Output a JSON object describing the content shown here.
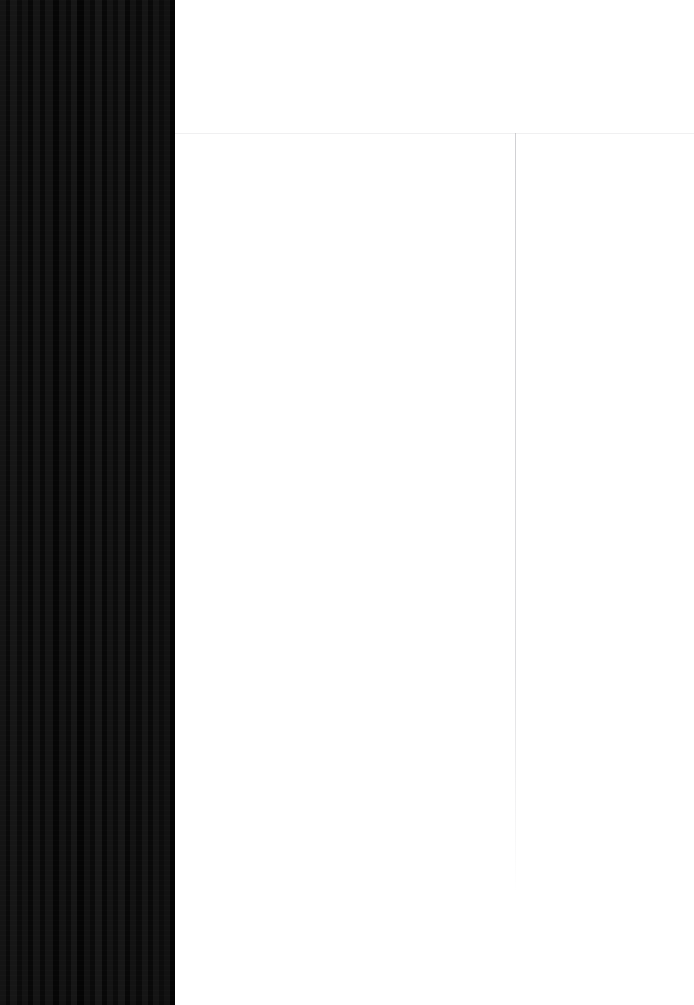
{
  "screen": {
    "width": 694,
    "height": 1005,
    "background_color": "#ffffff"
  },
  "side_panel": {
    "name": "dark-striped-panel",
    "x": 0,
    "y": 0,
    "width": 175,
    "height": 1005,
    "base_color": "#0d0d0d",
    "description": "Dark vertically striped column occupying the left edge of the frame",
    "stripes": [
      {
        "x": 0,
        "width": 6,
        "color": "#141414"
      },
      {
        "x": 6,
        "width": 4,
        "color": "#0a0a0a"
      },
      {
        "x": 10,
        "width": 7,
        "color": "#161616"
      },
      {
        "x": 17,
        "width": 5,
        "color": "#0b0b0b"
      },
      {
        "x": 22,
        "width": 6,
        "color": "#131313"
      },
      {
        "x": 28,
        "width": 5,
        "color": "#080808"
      },
      {
        "x": 33,
        "width": 7,
        "color": "#151515"
      },
      {
        "x": 40,
        "width": 5,
        "color": "#090909"
      },
      {
        "x": 45,
        "width": 8,
        "color": "#141414"
      },
      {
        "x": 53,
        "width": 6,
        "color": "#060606"
      },
      {
        "x": 59,
        "width": 7,
        "color": "#131313"
      },
      {
        "x": 66,
        "width": 5,
        "color": "#0a0a0a"
      },
      {
        "x": 71,
        "width": 6,
        "color": "#161616"
      },
      {
        "x": 77,
        "width": 7,
        "color": "#050505"
      },
      {
        "x": 84,
        "width": 6,
        "color": "#121212"
      },
      {
        "x": 90,
        "width": 5,
        "color": "#0a0a0a"
      },
      {
        "x": 95,
        "width": 7,
        "color": "#171717"
      },
      {
        "x": 102,
        "width": 5,
        "color": "#080808"
      },
      {
        "x": 107,
        "width": 6,
        "color": "#141414"
      },
      {
        "x": 113,
        "width": 5,
        "color": "#0b0b0b"
      },
      {
        "x": 118,
        "width": 7,
        "color": "#161616"
      },
      {
        "x": 125,
        "width": 5,
        "color": "#070707"
      },
      {
        "x": 130,
        "width": 6,
        "color": "#131313"
      },
      {
        "x": 136,
        "width": 6,
        "color": "#0a0a0a"
      },
      {
        "x": 142,
        "width": 6,
        "color": "#151515"
      },
      {
        "x": 148,
        "width": 5,
        "color": "#090909"
      },
      {
        "x": 153,
        "width": 6,
        "color": "#141414"
      },
      {
        "x": 159,
        "width": 5,
        "color": "#0c0c0c"
      },
      {
        "x": 164,
        "width": 6,
        "color": "#121212"
      },
      {
        "x": 170,
        "width": 5,
        "color": "#030303"
      }
    ]
  },
  "content_area": {
    "name": "content-pane",
    "x": 175,
    "y": 0,
    "width": 519,
    "height": 1005,
    "background_color": "#ffffff",
    "header": {
      "name": "content-header",
      "height": 133,
      "background_color": "#ffffff",
      "text": ""
    },
    "divider": {
      "name": "header-divider",
      "y": 133,
      "color": "#f0f0f1",
      "thickness": 1
    },
    "body": {
      "name": "content-body",
      "background_color": "#ffffff",
      "text": ""
    },
    "edge_rule": {
      "name": "right-edge-rule",
      "x": 690,
      "top": 133,
      "color": "#aaaaaf",
      "thickness": 1
    }
  }
}
